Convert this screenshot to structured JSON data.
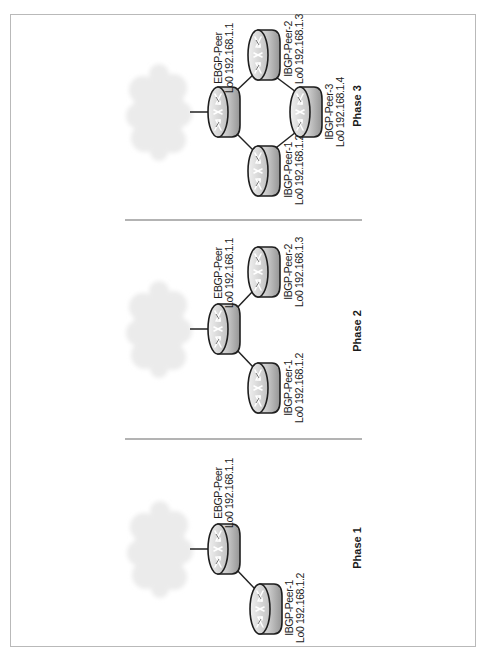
{
  "figure": {
    "orientation": "rotated-90-ccw-text",
    "colors": {
      "frame": "#b9b9b9",
      "separator": "#9a9a9a",
      "link": "#222222",
      "cloud": "#ececec",
      "router_light": "#e2e2e2",
      "router_dark": "#979797",
      "router_outline": "#1e1e1e"
    }
  },
  "phases": [
    {
      "title": "Phase 1",
      "cloud": {
        "icon": "internet-cloud-icon"
      },
      "routers": [
        {
          "role": "ebgp",
          "name": "EBGP-Peer",
          "loopback": "Lo0 192.168.1.1",
          "icon": "router-icon"
        },
        {
          "role": "ibgp",
          "name": "IBGP-Peer-1",
          "loopback": "Lo0 192.168.1.2",
          "icon": "router-icon"
        }
      ],
      "links": [
        [
          "cloud",
          "EBGP-Peer"
        ],
        [
          "EBGP-Peer",
          "IBGP-Peer-1"
        ]
      ]
    },
    {
      "title": "Phase 2",
      "cloud": {
        "icon": "internet-cloud-icon"
      },
      "routers": [
        {
          "role": "ebgp",
          "name": "EBGP-Peer",
          "loopback": "Lo0 192.168.1.1",
          "icon": "router-icon"
        },
        {
          "role": "ibgp",
          "name": "IBGP-Peer-1",
          "loopback": "Lo0 192.168.1.2",
          "icon": "router-icon"
        },
        {
          "role": "ibgp",
          "name": "IBGP-Peer-2",
          "loopback": "Lo0 192.168.1.3",
          "icon": "router-icon"
        }
      ],
      "links": [
        [
          "cloud",
          "EBGP-Peer"
        ],
        [
          "EBGP-Peer",
          "IBGP-Peer-1"
        ],
        [
          "EBGP-Peer",
          "IBGP-Peer-2"
        ]
      ]
    },
    {
      "title": "Phase 3",
      "cloud": {
        "icon": "internet-cloud-icon"
      },
      "routers": [
        {
          "role": "ebgp",
          "name": "EBGP-Peer",
          "loopback": "Lo0 192.168.1.1",
          "icon": "router-icon"
        },
        {
          "role": "ibgp",
          "name": "IBGP-Peer-1",
          "loopback": "Lo0 192.168.1.2",
          "icon": "router-icon"
        },
        {
          "role": "ibgp",
          "name": "IBGP-Peer-2",
          "loopback": "Lo0 192.168.1.3",
          "icon": "router-icon"
        },
        {
          "role": "ibgp",
          "name": "IBGP-Peer-3",
          "loopback": "Lo0 192.168.1.4",
          "icon": "router-icon"
        }
      ],
      "links": [
        [
          "cloud",
          "EBGP-Peer"
        ],
        [
          "EBGP-Peer",
          "IBGP-Peer-1"
        ],
        [
          "EBGP-Peer",
          "IBGP-Peer-2"
        ],
        [
          "IBGP-Peer-1",
          "IBGP-Peer-3"
        ],
        [
          "IBGP-Peer-2",
          "IBGP-Peer-3"
        ]
      ]
    }
  ]
}
